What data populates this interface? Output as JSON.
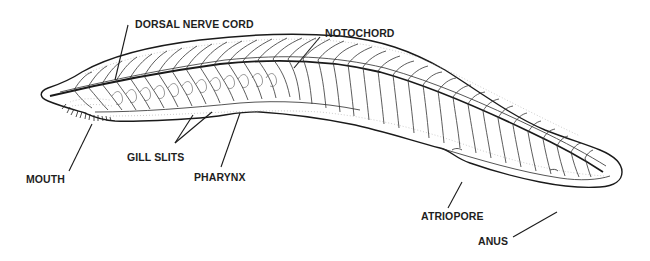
{
  "figure": {
    "labels": {
      "dorsal_nerve_cord": "DORSAL NERVE CORD",
      "notochord": "NOTOCHORD",
      "gill_slits": "GILL SLITS",
      "mouth": "MOUTH",
      "pharynx": "PHARYNX",
      "atriopore": "ATRIOPORE",
      "anus": "ANUS"
    },
    "colors": {
      "line": "#1a1a1a",
      "text": "#1e1e1e",
      "background": "#ffffff"
    }
  }
}
